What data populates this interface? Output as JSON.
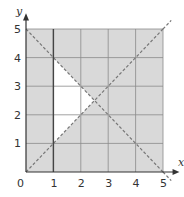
{
  "chart_data": {
    "type": "region-graph",
    "title": "",
    "xlabel": "x",
    "ylabel": "y",
    "xlim": [
      0,
      5
    ],
    "ylim": [
      0,
      5
    ],
    "grid": true,
    "x_ticks": [
      "0",
      "1",
      "2",
      "3",
      "4",
      "5"
    ],
    "y_ticks": [
      "1",
      "2",
      "3",
      "4",
      "5"
    ],
    "lines": [
      {
        "equation": "y = x",
        "style": "dashed",
        "from": [
          0,
          0
        ],
        "to": [
          5,
          5
        ]
      },
      {
        "equation": "x + y = 5",
        "style": "dashed",
        "from": [
          0,
          5
        ],
        "to": [
          5,
          0
        ]
      },
      {
        "equation": "x = 1",
        "style": "solid",
        "from": [
          1,
          0
        ],
        "to": [
          1,
          5
        ]
      }
    ],
    "unshaded_region": {
      "description": "Region satisfying x > 1, y > x, x + y < 5 left unshaded",
      "vertices": [
        [
          1,
          1
        ],
        [
          1,
          4
        ],
        [
          2.5,
          2.5
        ]
      ]
    },
    "shaded_color": "#d9d9d9",
    "unshaded_color": "#ffffff"
  },
  "labels": {
    "x_axis": "x",
    "y_axis": "y",
    "origin": "0"
  }
}
